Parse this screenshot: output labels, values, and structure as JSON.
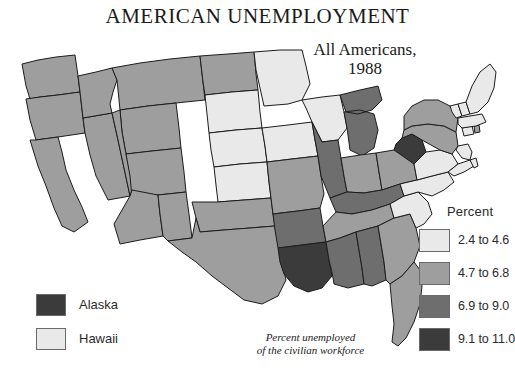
{
  "title": "AMERICAN UNEMPLOYMENT",
  "subtitle": {
    "line1": "All Americans,",
    "line2": "1988"
  },
  "footnote": {
    "line1": "Percent unemployed",
    "line2": "of the civilian workforce"
  },
  "legend": {
    "header": "Percent",
    "classes": [
      {
        "label": "2.4 to 4.6",
        "color": "#e9e9e9"
      },
      {
        "label": "4.7 to 6.8",
        "color": "#9e9e9e"
      },
      {
        "label": "6.9 to 9.0",
        "color": "#6e6e6e"
      },
      {
        "label": "9.1 to 11.0",
        "color": "#3b3b3b"
      }
    ]
  },
  "inset_legend": [
    {
      "label": "Alaska",
      "color": "#3b3b3b"
    },
    {
      "label": "Hawaii",
      "color": "#e9e9e9"
    }
  ],
  "chart_data": {
    "type": "map",
    "title": "AMERICAN UNEMPLOYMENT",
    "subtitle": "All Americans, 1988",
    "value_label": "Percent unemployed of the civilian workforce",
    "unit": "percent",
    "classes": [
      "2.4 to 4.6",
      "4.7 to 6.8",
      "6.9 to 9.0",
      "9.1 to 11.0"
    ],
    "class_colors": [
      "#e9e9e9",
      "#9e9e9e",
      "#6e6e6e",
      "#3b3b3b"
    ],
    "states": [
      {
        "code": "WA",
        "class": 1
      },
      {
        "code": "OR",
        "class": 1
      },
      {
        "code": "CA",
        "class": 1
      },
      {
        "code": "NV",
        "class": 1
      },
      {
        "code": "ID",
        "class": 1
      },
      {
        "code": "MT",
        "class": 1
      },
      {
        "code": "WY",
        "class": 1
      },
      {
        "code": "UT",
        "class": 1
      },
      {
        "code": "AZ",
        "class": 1
      },
      {
        "code": "CO",
        "class": 1
      },
      {
        "code": "NM",
        "class": 1
      },
      {
        "code": "ND",
        "class": 1
      },
      {
        "code": "SD",
        "class": 0
      },
      {
        "code": "NE",
        "class": 0
      },
      {
        "code": "KS",
        "class": 0
      },
      {
        "code": "OK",
        "class": 1
      },
      {
        "code": "TX",
        "class": 1
      },
      {
        "code": "MN",
        "class": 0
      },
      {
        "code": "IA",
        "class": 0
      },
      {
        "code": "MO",
        "class": 1
      },
      {
        "code": "AR",
        "class": 2
      },
      {
        "code": "LA",
        "class": 3
      },
      {
        "code": "WI",
        "class": 0
      },
      {
        "code": "IL",
        "class": 2
      },
      {
        "code": "MI",
        "class": 2
      },
      {
        "code": "IN",
        "class": 1
      },
      {
        "code": "OH",
        "class": 1
      },
      {
        "code": "KY",
        "class": 2
      },
      {
        "code": "TN",
        "class": 1
      },
      {
        "code": "MS",
        "class": 2
      },
      {
        "code": "AL",
        "class": 2
      },
      {
        "code": "GA",
        "class": 1
      },
      {
        "code": "FL",
        "class": 1
      },
      {
        "code": "SC",
        "class": 0
      },
      {
        "code": "NC",
        "class": 0
      },
      {
        "code": "VA",
        "class": 0
      },
      {
        "code": "WV",
        "class": 3
      },
      {
        "code": "MD",
        "class": 0
      },
      {
        "code": "DE",
        "class": 0
      },
      {
        "code": "PA",
        "class": 1
      },
      {
        "code": "NJ",
        "class": 0
      },
      {
        "code": "NY",
        "class": 1
      },
      {
        "code": "CT",
        "class": 0
      },
      {
        "code": "RI",
        "class": 1
      },
      {
        "code": "MA",
        "class": 0
      },
      {
        "code": "VT",
        "class": 0
      },
      {
        "code": "NH",
        "class": 0
      },
      {
        "code": "ME",
        "class": 0
      },
      {
        "code": "AK",
        "class": 3
      },
      {
        "code": "HI",
        "class": 0
      }
    ]
  }
}
